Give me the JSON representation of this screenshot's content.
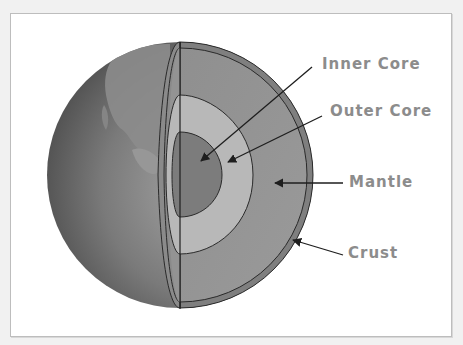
{
  "diagram": {
    "labels": {
      "inner_core": "Inner Core",
      "outer_core": "Outer Core",
      "mantle": "Mantle",
      "crust": "Crust"
    },
    "colors": {
      "background": "#f1f1f1",
      "panel": "#ffffff",
      "label_text": "#8c8c8c",
      "arrow": "#1e1e1e",
      "globe_dark": "#4a4a4a",
      "globe_light": "#9a9a9a",
      "continent": "#8e8e8e",
      "crust": "#7d7d7d",
      "mantle": "#939393",
      "outer_core": "#b7b7b7",
      "inner_core": "#7c7c7c"
    }
  }
}
